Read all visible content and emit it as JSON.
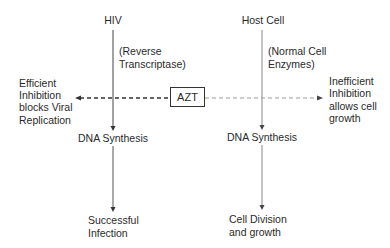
{
  "diagram": {
    "left_column": {
      "title": "HIV",
      "enzyme_line1": "(Reverse",
      "enzyme_line2": "Transcriptase)",
      "process": "DNA Synthesis",
      "outcome_line1": "Successful",
      "outcome_line2": "Infection"
    },
    "right_column": {
      "title": "Host Cell",
      "enzyme_line1": "(Normal Cell",
      "enzyme_line2": "Enzymes)",
      "process": "DNA Synthesis",
      "outcome_line1": "Cell Division",
      "outcome_line2": "and growth"
    },
    "inhibitor": {
      "label": "AZT"
    },
    "left_effect": {
      "line1": "Efficient",
      "line2": "Inhibition",
      "line3": "blocks Viral",
      "line4": "Replication"
    },
    "right_effect": {
      "line1": "Inefficient",
      "line2": "Inhibition",
      "line3": "allows cell",
      "line4": "growth"
    },
    "colors": {
      "line_dark": "#333333",
      "line_light": "#9a9a9a",
      "text": "#2a2a2a"
    }
  }
}
